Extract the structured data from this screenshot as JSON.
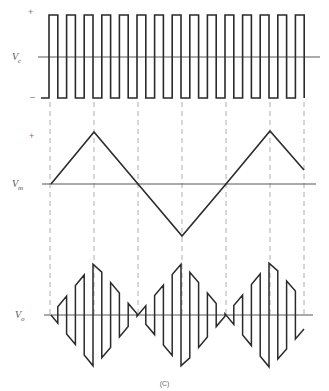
{
  "figure": {
    "caption": "(C)",
    "colors": {
      "waveform": "#2a2a2a",
      "axis": "#444444",
      "guide": "#9a9a9a",
      "label": "#555555"
    }
  },
  "panels": {
    "carrier": {
      "label_main": "V",
      "label_sub": "c",
      "plus": "+",
      "minus": "–"
    },
    "modulating": {
      "label_main": "V",
      "label_sub": "m",
      "plus": "+"
    },
    "output": {
      "label_main": "V",
      "label_sub": "o"
    }
  },
  "chart_data": {
    "type": "line",
    "title": "(C)",
    "series": [
      {
        "name": "Vc",
        "description": "carrier square wave, ±1, 15 pulses",
        "pulse_count": 15,
        "levels": [
          "+",
          "–"
        ]
      },
      {
        "name": "Vm",
        "description": "modulating triangle wave",
        "x_guides": [
          0,
          1,
          2,
          3,
          4,
          5,
          6
        ],
        "values": [
          0,
          1,
          0,
          -1,
          0,
          1,
          0.25
        ]
      },
      {
        "name": "Vo",
        "description": "output = carrier switched by Vm (Vo = -sign(Vc)·Vm), envelope follows |Vm|"
      }
    ],
    "geometry": {
      "x_start": 51,
      "x_end": 304,
      "guides_x": [
        50,
        94,
        138,
        182,
        226,
        270,
        304
      ],
      "vc": {
        "axis_y": 57,
        "high_y": 15,
        "low_y": 98,
        "first_rise_x": 49,
        "period": 17.6,
        "pulses": 15,
        "pre_low_x": 41
      },
      "vm": {
        "axis_y": 184,
        "amp": 52,
        "points": [
          [
            51,
            184
          ],
          [
            94,
            132
          ],
          [
            138,
            184
          ],
          [
            182,
            236
          ],
          [
            226,
            184
          ],
          [
            270,
            131
          ],
          [
            304,
            170
          ]
        ]
      },
      "vo": {
        "axis_y": 315,
        "scale": 1.0
      }
    }
  }
}
